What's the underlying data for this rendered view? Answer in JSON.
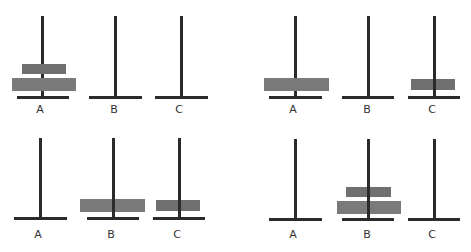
{
  "panels": [
    {
      "name": "state-1",
      "labels": [
        "A",
        "B",
        "C"
      ],
      "disks": {
        "A": [
          "large",
          "small"
        ],
        "B": [],
        "C": []
      }
    },
    {
      "name": "state-2",
      "labels": [
        "A",
        "B",
        "C"
      ],
      "disks": {
        "A": [
          "large"
        ],
        "B": [],
        "C": [
          "small"
        ]
      }
    },
    {
      "name": "state-3",
      "labels": [
        "A",
        "B",
        "C"
      ],
      "disks": {
        "A": [],
        "B": [
          "large"
        ],
        "C": [
          "small"
        ]
      }
    },
    {
      "name": "state-4",
      "labels": [
        "A",
        "B",
        "C"
      ],
      "disks": {
        "A": [],
        "B": [
          "large",
          "small"
        ],
        "C": []
      }
    }
  ],
  "colors": {
    "peg": "#2b2b2b",
    "disk_large": "#7a7a7a",
    "disk_small": "#6f6f6f"
  }
}
